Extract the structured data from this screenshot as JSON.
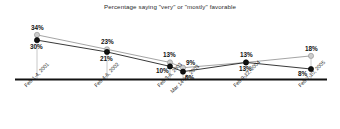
{
  "chart_data": {
    "type": "line",
    "title": "Percentage saying \"very\" or \"mostly\" favorable",
    "xlabel": "",
    "ylabel": "",
    "ylim": [
      0,
      40
    ],
    "grid": false,
    "legend": "none",
    "categories": [
      "Feb 1-4, 2001",
      "Feb 4-6, 2002",
      "Feb 3-6, 2003",
      "Mar 14-15, 2003",
      "Feb 9-12, 2004",
      "Feb 7-10, 2005"
    ],
    "series": [
      {
        "name": "series-light",
        "marker": "light-gray-circle",
        "color": "#cccccc",
        "values": [
          34,
          23,
          13,
          9,
          13,
          18
        ],
        "labels": [
          "34%",
          "23%",
          "13%",
          "9%",
          "13%",
          "18%"
        ]
      },
      {
        "name": "series-dark",
        "marker": "black-circle",
        "color": "#111111",
        "values": [
          30,
          21,
          10,
          6,
          13,
          8
        ],
        "labels": [
          "30%",
          "21%",
          "10%",
          "6%",
          "13%",
          "8%"
        ]
      }
    ],
    "axis_color": "#111111",
    "droplines_color": "#c8c8c8"
  }
}
